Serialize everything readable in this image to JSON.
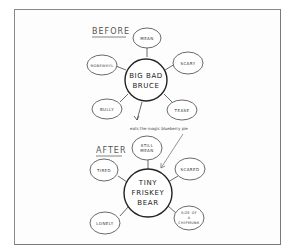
{
  "diagram": {
    "type": "before-after mind map",
    "before": {
      "heading": "BEFORE",
      "center": {
        "line1": "BIG BAD",
        "line2": "BRUCE"
      },
      "traits": [
        {
          "id": "mean",
          "label": "MEAN"
        },
        {
          "id": "scary",
          "label": "SCARY"
        },
        {
          "id": "tease",
          "label": "TEASE"
        },
        {
          "id": "bully",
          "label": "BULLY"
        },
        {
          "id": "mobewhyl",
          "label": "MOBEWHYL"
        }
      ]
    },
    "transition": {
      "note": "eats the magic blueberry pie"
    },
    "after": {
      "heading": "AFTER",
      "center": {
        "line1": "TINY",
        "line2": "FRISKEY",
        "line3": "BEAR"
      },
      "traits": [
        {
          "id": "still-mean",
          "line1": "STILL",
          "line2": "MEAN"
        },
        {
          "id": "scared",
          "line1": "SCARED"
        },
        {
          "id": "size-of-chipmunk",
          "line1": "SIZE OF",
          "line2": "A",
          "line3": "CHIPMUNK"
        },
        {
          "id": "lonely",
          "line1": "LONELY"
        },
        {
          "id": "tired",
          "line1": "TIRED"
        }
      ]
    },
    "colors": {
      "ink": "#333333",
      "frame": "#8a8a8a",
      "background": "#ffffff"
    }
  }
}
